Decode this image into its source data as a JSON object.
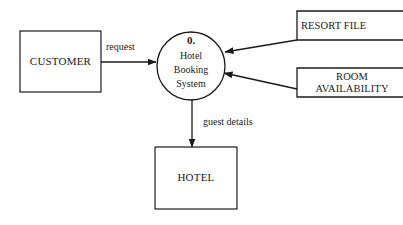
{
  "diagram": {
    "type": "data-flow-diagram",
    "background_color": "#ffffff",
    "line_color": "#1a1a1a",
    "process": {
      "number": "0.",
      "name_lines": [
        "Hotel",
        "Booking",
        "System"
      ],
      "shape": "circle",
      "center_x": 191,
      "center_y": 66,
      "radius": 34
    },
    "external_entities": [
      {
        "id": "customer",
        "label": "CUSTOMER",
        "shape": "rectangle",
        "x": 20,
        "y": 31,
        "width": 81,
        "height": 61
      },
      {
        "id": "hotel",
        "label": "HOTEL",
        "shape": "rectangle",
        "x": 155,
        "y": 147,
        "width": 82,
        "height": 62
      }
    ],
    "data_stores": [
      {
        "id": "resort-file",
        "label_lines": [
          "RESORT FILE"
        ],
        "shape": "open-rectangle",
        "x": 297,
        "y": 11,
        "width": 106,
        "height": 29
      },
      {
        "id": "room-availability",
        "label_lines": [
          "ROOM",
          "AVAILABILITY"
        ],
        "shape": "open-rectangle",
        "x": 297,
        "y": 68,
        "width": 106,
        "height": 29
      }
    ],
    "data_flows": [
      {
        "id": "request",
        "label": "request",
        "from": "customer",
        "to": "process",
        "label_x": 106,
        "label_y": 48,
        "direction": "left-to-right"
      },
      {
        "id": "guest-details",
        "label": "guest details",
        "from": "process",
        "to": "hotel",
        "label_x": 200,
        "label_y": 123,
        "direction": "top-to-bottom"
      },
      {
        "id": "resort-data",
        "label": "",
        "from": "resort-file",
        "to": "process",
        "direction": "diagonal-down-left"
      },
      {
        "id": "availability-data",
        "label": "",
        "from": "room-availability",
        "to": "process",
        "direction": "diagonal-up-left"
      }
    ]
  }
}
